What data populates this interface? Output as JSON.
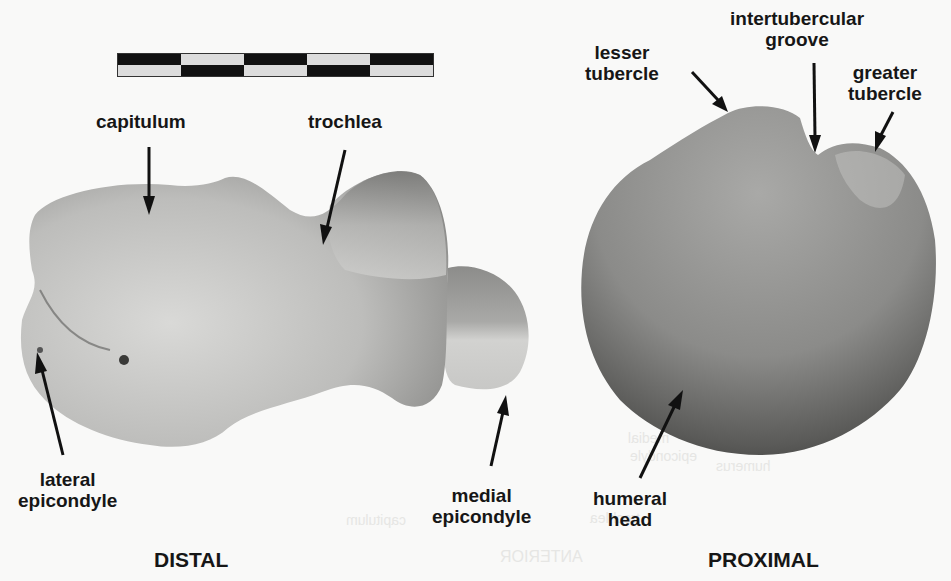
{
  "figure": {
    "scale_bar_segments": 5,
    "colors": {
      "background": "#f9f9f8",
      "label": "#161616",
      "bone_light": "#c9c9c7",
      "bone_dark": "#4a4a48"
    }
  },
  "distal": {
    "view_label": "DISTAL",
    "labels": {
      "capitulum": "capitulum",
      "trochlea": "trochlea",
      "lateral_epicondyle": [
        "lateral",
        "epicondyle"
      ],
      "medial_epicondyle": [
        "medial",
        "epicondyle"
      ]
    }
  },
  "proximal": {
    "view_label": "PROXIMAL",
    "labels": {
      "lesser_tubercle": [
        "lesser",
        "tubercle"
      ],
      "intertubercular_groove": [
        "intertubercular",
        "groove"
      ],
      "greater_tubercle": [
        "greater",
        "tubercle"
      ],
      "humeral_head": [
        "humeral",
        "head"
      ]
    }
  },
  "bleed_through": {
    "anterior": "ANTERIOR",
    "capitulum": "capitulum",
    "trochlea": "trochlea",
    "medial": "medial",
    "epicondyle": "epicondyle",
    "humerus": "humerus"
  }
}
